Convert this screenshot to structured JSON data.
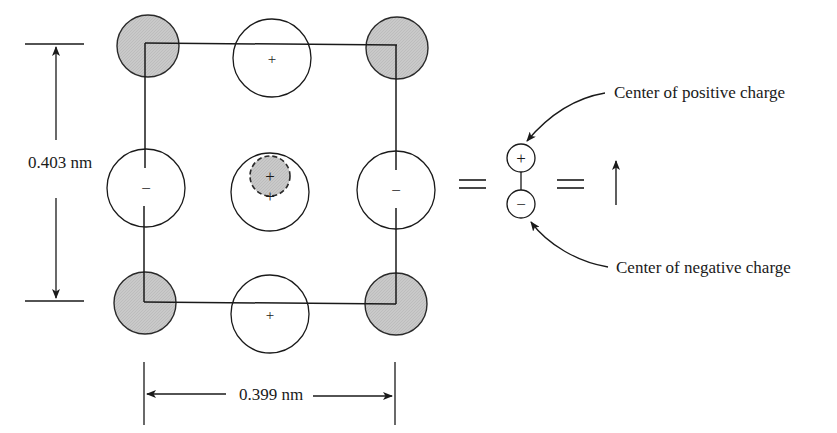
{
  "diagram": {
    "dimensions": {
      "vertical_label": "0.403 nm",
      "horizontal_label": "0.399 nm"
    },
    "lattice": {
      "corner_ions": [
        "shaded",
        "shaded",
        "shaded",
        "shaded"
      ],
      "edge_ions": {
        "top": "+",
        "bottom": "+",
        "left": "−",
        "right": "−"
      },
      "center_ion": {
        "outer_sign": "+",
        "inner_sign": "+"
      }
    },
    "equals_1": "=",
    "equals_2": "=",
    "dipole": {
      "positive_sign": "+",
      "negative_sign": "−"
    },
    "annotations": {
      "positive": "Center of positive charge",
      "negative": "Center of negative charge"
    },
    "colors": {
      "line": "#1a1a1a",
      "shaded_fill": "#c8c8c8",
      "background": "#ffffff"
    }
  }
}
